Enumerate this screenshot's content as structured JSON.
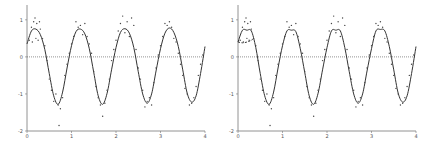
{
  "chart_data": [
    {
      "type": "scatter",
      "title": "",
      "xlabel": "",
      "ylabel": "",
      "xlim": [
        0,
        4
      ],
      "ylim": [
        -2,
        1.4
      ],
      "xticks": [
        "0",
        "1",
        "2",
        "3",
        "4"
      ],
      "yticks": [
        "1",
        "0",
        "-1",
        "-2"
      ],
      "grid": false,
      "reference_line": {
        "y": 0,
        "style": "dotted"
      },
      "series": [
        {
          "name": "fit",
          "kind": "line",
          "style": "solid",
          "x": [
            0,
            0.1,
            0.2,
            0.3,
            0.4,
            0.5,
            0.6,
            0.7,
            0.8,
            0.9,
            1.0,
            1.1,
            1.2,
            1.3,
            1.4,
            1.5,
            1.6,
            1.7,
            1.8,
            1.9,
            2.0,
            2.1,
            2.2,
            2.3,
            2.4,
            2.5,
            2.6,
            2.7,
            2.8,
            2.9,
            3.0,
            3.1,
            3.2,
            3.3,
            3.4,
            3.5,
            3.6,
            3.7,
            3.8,
            3.9,
            4.0
          ],
          "y": [
            0.35,
            0.7,
            0.75,
            0.6,
            0.2,
            -0.45,
            -1.05,
            -1.28,
            -0.95,
            -0.3,
            0.3,
            0.68,
            0.75,
            0.62,
            0.22,
            -0.42,
            -1.05,
            -1.28,
            -0.98,
            -0.35,
            0.25,
            0.66,
            0.76,
            0.64,
            0.25,
            -0.4,
            -1.0,
            -1.25,
            -1.0,
            -0.38,
            0.22,
            0.64,
            0.78,
            0.66,
            0.28,
            -0.35,
            -0.98,
            -1.22,
            -1.05,
            -0.45,
            0.28
          ]
        },
        {
          "name": "observations",
          "kind": "points",
          "x": [
            0.05,
            0.1,
            0.12,
            0.15,
            0.18,
            0.2,
            0.22,
            0.25,
            0.28,
            0.3,
            0.35,
            0.4,
            0.45,
            0.5,
            0.55,
            0.6,
            0.65,
            0.7,
            0.72,
            0.75,
            0.8,
            0.85,
            0.9,
            0.95,
            1.0,
            1.05,
            1.1,
            1.15,
            1.2,
            1.25,
            1.3,
            1.35,
            1.4,
            1.45,
            1.5,
            1.55,
            1.6,
            1.65,
            1.7,
            1.75,
            1.8,
            1.85,
            1.9,
            1.95,
            2.0,
            2.05,
            2.1,
            2.15,
            2.2,
            2.25,
            2.3,
            2.35,
            2.4,
            2.45,
            2.5,
            2.55,
            2.6,
            2.65,
            2.7,
            2.75,
            2.8,
            2.85,
            2.9,
            2.95,
            3.0,
            3.05,
            3.1,
            3.15,
            3.2,
            3.25,
            3.3,
            3.35,
            3.4,
            3.45,
            3.5,
            3.55,
            3.6,
            3.65,
            3.7,
            3.75,
            3.8,
            3.85,
            3.9,
            3.95
          ],
          "y": [
            0.45,
            0.8,
            0.4,
            0.95,
            1.05,
            0.5,
            0.9,
            0.45,
            0.95,
            0.75,
            0.5,
            0.3,
            -0.1,
            -0.6,
            -0.9,
            -1.2,
            -1.0,
            -1.3,
            -1.85,
            -1.4,
            -1.1,
            -0.5,
            -0.2,
            0.1,
            0.35,
            0.55,
            0.95,
            0.8,
            0.85,
            0.6,
            0.9,
            0.55,
            0.35,
            0.1,
            -0.4,
            -0.8,
            -1.1,
            -1.3,
            -1.6,
            -1.25,
            -0.9,
            -0.6,
            -0.1,
            0.2,
            0.45,
            0.7,
            0.9,
            1.1,
            0.65,
            0.95,
            0.55,
            1.05,
            0.85,
            0.2,
            -0.3,
            -0.6,
            -0.9,
            -1.35,
            -1.2,
            -1.1,
            -1.3,
            -0.7,
            -0.3,
            0.05,
            0.3,
            0.55,
            0.9,
            0.85,
            0.95,
            0.8,
            0.5,
            0.4,
            0.1,
            -0.2,
            -0.5,
            -0.85,
            -1.0,
            -1.3,
            -1.25,
            -1.1,
            -0.8,
            -0.5,
            -0.2,
            0.05
          ]
        }
      ]
    },
    {
      "type": "scatter",
      "title": "",
      "xlabel": "",
      "ylabel": "",
      "xlim": [
        0,
        4
      ],
      "ylim": [
        -2,
        1.4
      ],
      "xticks": [
        "0",
        "1",
        "2",
        "3",
        "4"
      ],
      "yticks": [
        "1",
        "0",
        "-1",
        "-2"
      ],
      "grid": false,
      "reference_line": {
        "y": 0,
        "style": "dotted"
      },
      "series": [
        {
          "name": "fit",
          "kind": "line",
          "style": "solid",
          "x": [
            0,
            0.1,
            0.2,
            0.3,
            0.4,
            0.5,
            0.6,
            0.7,
            0.8,
            0.9,
            1.0,
            1.1,
            1.2,
            1.3,
            1.4,
            1.5,
            1.6,
            1.7,
            1.8,
            1.9,
            2.0,
            2.1,
            2.2,
            2.3,
            2.4,
            2.5,
            2.6,
            2.7,
            2.8,
            2.9,
            3.0,
            3.1,
            3.2,
            3.3,
            3.4,
            3.5,
            3.6,
            3.7,
            3.8,
            3.9,
            4.0
          ],
          "y": [
            0.4,
            0.72,
            0.72,
            0.7,
            0.25,
            -0.45,
            -1.05,
            -1.28,
            -0.95,
            -0.3,
            0.3,
            0.7,
            0.72,
            0.68,
            0.22,
            -0.42,
            -1.05,
            -1.28,
            -0.98,
            -0.35,
            0.25,
            0.7,
            0.72,
            0.7,
            0.25,
            -0.4,
            -1.0,
            -1.25,
            -1.0,
            -0.38,
            0.22,
            0.7,
            0.74,
            0.7,
            0.28,
            -0.35,
            -0.98,
            -1.22,
            -1.05,
            -0.45,
            0.28
          ]
        },
        {
          "name": "alt-fit",
          "kind": "line",
          "style": "dashed",
          "x": [
            0,
            0.1,
            0.2,
            0.3,
            0.35
          ],
          "y": [
            0.4,
            0.38,
            0.4,
            0.45,
            0.5
          ]
        },
        {
          "name": "observations",
          "kind": "points",
          "x": [
            0.05,
            0.1,
            0.12,
            0.15,
            0.18,
            0.2,
            0.22,
            0.25,
            0.28,
            0.3,
            0.35,
            0.4,
            0.45,
            0.5,
            0.55,
            0.6,
            0.65,
            0.7,
            0.72,
            0.75,
            0.8,
            0.85,
            0.9,
            0.95,
            1.0,
            1.05,
            1.1,
            1.15,
            1.2,
            1.25,
            1.3,
            1.35,
            1.4,
            1.45,
            1.5,
            1.55,
            1.6,
            1.65,
            1.7,
            1.75,
            1.8,
            1.85,
            1.9,
            1.95,
            2.0,
            2.05,
            2.1,
            2.15,
            2.2,
            2.25,
            2.3,
            2.35,
            2.4,
            2.45,
            2.5,
            2.55,
            2.6,
            2.65,
            2.7,
            2.75,
            2.8,
            2.85,
            2.9,
            2.95,
            3.0,
            3.05,
            3.1,
            3.15,
            3.2,
            3.25,
            3.3,
            3.35,
            3.4,
            3.45,
            3.5,
            3.55,
            3.6,
            3.65,
            3.7,
            3.75,
            3.8,
            3.85,
            3.9,
            3.95
          ],
          "y": [
            0.45,
            0.8,
            0.4,
            0.95,
            1.05,
            0.5,
            0.9,
            0.45,
            0.95,
            0.75,
            0.5,
            0.3,
            -0.1,
            -0.6,
            -0.9,
            -1.2,
            -1.0,
            -1.3,
            -1.85,
            -1.4,
            -1.1,
            -0.5,
            -0.2,
            0.1,
            0.35,
            0.55,
            0.95,
            0.8,
            0.85,
            0.6,
            0.9,
            0.55,
            0.35,
            0.1,
            -0.4,
            -0.8,
            -1.1,
            -1.3,
            -1.6,
            -1.25,
            -0.9,
            -0.6,
            -0.1,
            0.2,
            0.45,
            0.7,
            0.9,
            1.1,
            0.65,
            0.95,
            0.55,
            1.05,
            0.85,
            0.2,
            -0.3,
            -0.6,
            -0.9,
            -1.35,
            -1.2,
            -1.1,
            -1.3,
            -0.7,
            -0.3,
            0.05,
            0.3,
            0.55,
            0.9,
            0.85,
            0.95,
            0.8,
            0.5,
            0.4,
            0.1,
            -0.2,
            -0.5,
            -0.85,
            -1.0,
            -1.3,
            -1.25,
            -1.1,
            -0.8,
            -0.5,
            -0.2,
            0.05
          ]
        }
      ]
    }
  ],
  "colors": {
    "line": "#333333",
    "points": "#444444",
    "axis": "#777777",
    "zero_line": "#666666"
  }
}
